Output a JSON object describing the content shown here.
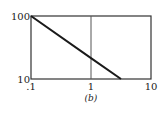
{
  "chart_data": {
    "type": "line",
    "title": "",
    "caption": "(b)",
    "xlabel": "",
    "ylabel": "",
    "xscale": "log",
    "yscale": "log",
    "xlim": [
      0.1,
      10
    ],
    "ylim": [
      10,
      100
    ],
    "x_ticks": [
      {
        "value": 0.1,
        "label": ".1"
      },
      {
        "value": 1,
        "label": "1"
      },
      {
        "value": 10,
        "label": "10"
      }
    ],
    "y_ticks": [
      {
        "value": 10,
        "label": "10"
      },
      {
        "value": 100,
        "label": "100"
      }
    ],
    "grid": {
      "vertical_at": [
        1
      ]
    },
    "series": [
      {
        "name": "line",
        "x": [
          0.1,
          1,
          3.16
        ],
        "y": [
          100,
          21.5,
          10
        ]
      }
    ],
    "legend": null
  },
  "colors": {
    "axis": "#333333",
    "line": "#1a1a1a",
    "grid": "#555555"
  }
}
